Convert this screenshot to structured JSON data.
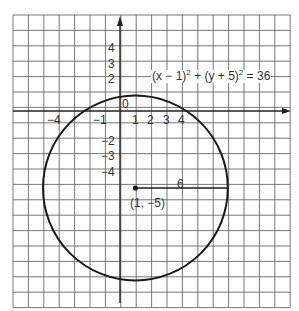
{
  "figure": {
    "equation": {
      "part1": "(x − 1)",
      "exp1": "2",
      "part2": " + (y + 5)",
      "exp2": "2",
      "part3": " = 36"
    },
    "origin_label": "0",
    "center_label": "(1, −5)",
    "radius_label": "6",
    "x_tick_labels": [
      {
        "value": -4,
        "text": "−4"
      },
      {
        "value": -1,
        "text": "−1"
      },
      {
        "value": 1,
        "text": "1"
      },
      {
        "value": 2,
        "text": "2"
      },
      {
        "value": 3,
        "text": "3"
      },
      {
        "value": 4,
        "text": "4"
      }
    ],
    "y_tick_labels": [
      {
        "value": 4,
        "text": "4"
      },
      {
        "value": 3,
        "text": "3"
      },
      {
        "value": 2,
        "text": "2"
      },
      {
        "value": -2,
        "text": "−2"
      },
      {
        "value": -3,
        "text": "−3"
      },
      {
        "value": -4,
        "text": "−4"
      }
    ],
    "circle": {
      "center": [
        1,
        -5
      ],
      "radius": 6
    },
    "grid": {
      "x_min": -7,
      "x_max": 11,
      "y_min": -13,
      "y_max": 6
    },
    "colors": {
      "grid": "#555555",
      "curve": "#1a1a1a",
      "axis": "#222222",
      "text": "#333333"
    }
  }
}
